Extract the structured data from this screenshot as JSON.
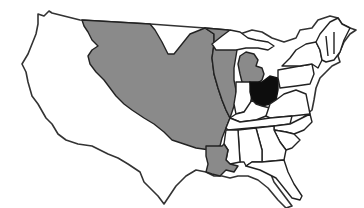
{
  "map": {
    "subject": "United States outline map",
    "colors": {
      "background": "#ffffff",
      "shaded_region": "#8a8a8a",
      "highlighted_state": "#0d0d0d",
      "border": "#222222"
    },
    "regions": [
      {
        "name": "western-region",
        "fill": "white"
      },
      {
        "name": "louisiana-purchase-region",
        "fill": "gray"
      },
      {
        "name": "upper-mississippi-region",
        "fill": "gray"
      },
      {
        "name": "michigan-lower-peninsula",
        "fill": "gray"
      },
      {
        "name": "louisiana",
        "fill": "gray"
      },
      {
        "name": "ohio",
        "fill": "black"
      },
      {
        "name": "eastern-states",
        "fill": "white"
      },
      {
        "name": "southern-states",
        "fill": "white"
      },
      {
        "name": "new-england",
        "fill": "white"
      }
    ]
  }
}
